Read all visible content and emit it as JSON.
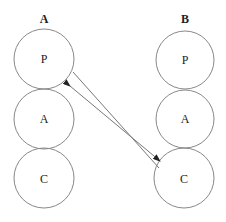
{
  "diagram": {
    "columns": [
      {
        "label": "A",
        "nodes": [
          "P",
          "A",
          "C"
        ]
      },
      {
        "label": "B",
        "nodes": [
          "P",
          "A",
          "C"
        ]
      }
    ],
    "connection": {
      "from": "A.P",
      "to": "B.C",
      "type": "bidirectional-arrow-with-parallel-line"
    }
  }
}
